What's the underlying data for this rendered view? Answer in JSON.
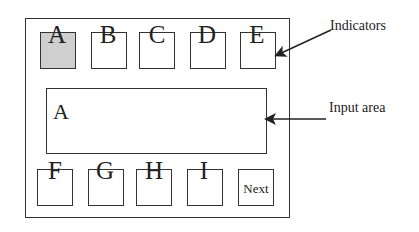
{
  "indicators": [
    {
      "label": "A",
      "active": true
    },
    {
      "label": "B",
      "active": false
    },
    {
      "label": "C",
      "active": false
    },
    {
      "label": "D",
      "active": false
    },
    {
      "label": "E",
      "active": false
    }
  ],
  "keys": [
    {
      "label": "F"
    },
    {
      "label": "G"
    },
    {
      "label": "H"
    },
    {
      "label": "I"
    }
  ],
  "next_button": {
    "label": "Next"
  },
  "input_area": {
    "value": "A"
  },
  "annotations": {
    "indicators_label": "Indicators",
    "input_area_label": "Input area"
  },
  "colors": {
    "active_indicator": "#cfcfcf",
    "stroke": "#333333"
  }
}
